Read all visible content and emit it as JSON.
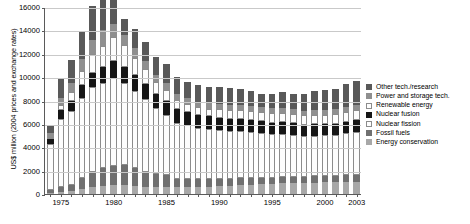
{
  "chart_data": {
    "type": "bar",
    "subtype": "stacked-bar",
    "title": "",
    "xlabel": "",
    "ylabel": "US$ million (2004 prices and exchange rates)",
    "ylim": [
      0,
      16000
    ],
    "ytick_values": [
      0,
      2000,
      4000,
      6000,
      8000,
      10000,
      12000,
      14000,
      16000
    ],
    "ytick_labels": [
      "0",
      "2000",
      "4000",
      "6000",
      "8000",
      "10000",
      "12000",
      "14000",
      "16000"
    ],
    "grid": true,
    "grid_axis": "y",
    "legend_position": "right",
    "xtick_labels": [
      "1975",
      "1980",
      "1985",
      "1990",
      "1995",
      "2000",
      "2003"
    ],
    "xtick_years": [
      1975,
      1980,
      1985,
      1990,
      1995,
      2000,
      2003
    ],
    "categories": [
      1974,
      1975,
      1976,
      1977,
      1978,
      1979,
      1980,
      1981,
      1982,
      1983,
      1984,
      1985,
      1986,
      1987,
      1988,
      1989,
      1990,
      1991,
      1992,
      1993,
      1994,
      1995,
      1996,
      1997,
      1998,
      1999,
      2000,
      2001,
      2002,
      2003
    ],
    "series": [
      {
        "name": "Energy conservation",
        "key": "energy_conservation",
        "color": "#a8a8a8",
        "values": [
          120,
          180,
          260,
          430,
          620,
          700,
          760,
          780,
          700,
          640,
          620,
          600,
          560,
          580,
          600,
          620,
          660,
          700,
          760,
          800,
          840,
          860,
          900,
          920,
          960,
          980,
          1000,
          1020,
          1040,
          1060
        ]
      },
      {
        "name": "Fossil fuels",
        "key": "fossil_fuels",
        "color": "#707070",
        "values": [
          260,
          380,
          520,
          900,
          1300,
          1500,
          1600,
          1680,
          1500,
          1280,
          1100,
          1000,
          760,
          700,
          660,
          640,
          620,
          600,
          600,
          580,
          560,
          540,
          560,
          540,
          520,
          520,
          520,
          540,
          560,
          580
        ]
      },
      {
        "name": "Nuclear fission",
        "key": "nuclear_fission",
        "color": "#fdfdfd",
        "values": [
          3900,
          5900,
          6300,
          6900,
          7200,
          7300,
          7600,
          7000,
          6600,
          6200,
          5600,
          5200,
          4800,
          4600,
          4400,
          4300,
          4200,
          4100,
          4000,
          3900,
          3800,
          3700,
          3700,
          3600,
          3500,
          3500,
          3500,
          3500,
          3600,
          3700
        ]
      },
      {
        "name": "Nuclear fusion",
        "key": "nuclear_fusion",
        "color": "#161616",
        "values": [
          430,
          700,
          900,
          1100,
          1250,
          1350,
          1450,
          1420,
          1380,
          1300,
          1250,
          1200,
          1150,
          1120,
          1100,
          1080,
          1060,
          1050,
          1040,
          1030,
          1020,
          1000,
          1000,
          980,
          960,
          960,
          960,
          960,
          980,
          1000
        ]
      },
      {
        "name": "Renewable energy",
        "key": "renewable_energy",
        "color": "#fdfdfd",
        "values": [
          170,
          420,
          760,
          1200,
          1600,
          1850,
          2000,
          1850,
          1500,
          1250,
          1000,
          900,
          760,
          700,
          680,
          680,
          700,
          720,
          760,
          780,
          800,
          800,
          800,
          780,
          780,
          800,
          800,
          800,
          820,
          850
        ]
      },
      {
        "name": "Power and storage tech.",
        "key": "power_storage",
        "color": "#8f8f8f",
        "values": [
          330,
          600,
          800,
          1000,
          1200,
          1300,
          1150,
          900,
          800,
          700,
          620,
          560,
          500,
          480,
          460,
          460,
          460,
          450,
          450,
          440,
          440,
          430,
          430,
          420,
          420,
          420,
          420,
          420,
          430,
          440
        ]
      },
      {
        "name": "Other tech./research",
        "key": "other_tech",
        "color": "#595959",
        "values": [
          690,
          1700,
          1960,
          2370,
          2930,
          3100,
          2540,
          1370,
          1620,
          1630,
          1560,
          1640,
          1470,
          1420,
          1400,
          1420,
          1500,
          1480,
          1390,
          1270,
          1140,
          1270,
          1310,
          1360,
          1460,
          1620,
          1700,
          1760,
          1970,
          2070
        ]
      }
    ],
    "totals": [
      5900,
      9880,
      11500,
      13900,
      16100,
      17100,
      17100,
      15000,
      14100,
      13000,
      11750,
      11100,
      10000,
      9600,
      9300,
      9200,
      9200,
      9100,
      9000,
      8800,
      8600,
      8600,
      8700,
      8600,
      8600,
      8800,
      8900,
      9000,
      9400,
      9700
    ],
    "legend": [
      {
        "label": "Other tech./research",
        "key": "other_tech",
        "color": "#595959"
      },
      {
        "label": "Power and storage tech.",
        "key": "power_storage",
        "color": "#8f8f8f"
      },
      {
        "label": "Renewable energy",
        "key": "renewable_energy",
        "color": "#fdfdfd"
      },
      {
        "label": "Nuclear fusion",
        "key": "nuclear_fusion",
        "color": "#161616"
      },
      {
        "label": "Nuclear fission",
        "key": "nuclear_fission",
        "color": "#fdfdfd"
      },
      {
        "label": "Fossil fuels",
        "key": "fossil_fuels",
        "color": "#707070"
      },
      {
        "label": "Energy conservation",
        "key": "energy_conservation",
        "color": "#a8a8a8"
      }
    ]
  }
}
